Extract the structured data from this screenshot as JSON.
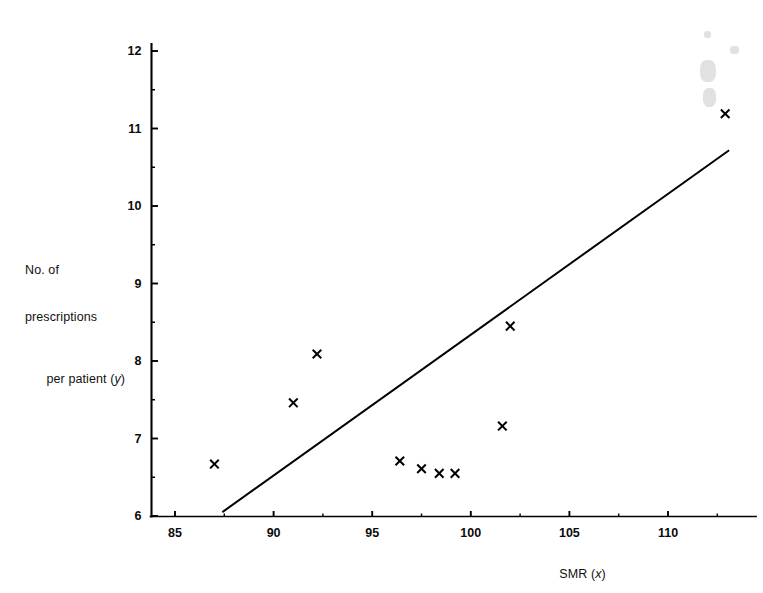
{
  "figure": {
    "background_color": "#ffffff",
    "ink_color": "#000000"
  },
  "chart_data": {
    "type": "scatter",
    "title": "",
    "xlabel": "SMR (x)",
    "ylabel_lines": [
      "No. of",
      "prescriptions",
      "per patient (y)"
    ],
    "ylabel": "No. of prescriptions per patient (y)",
    "marker": "x",
    "grid": false,
    "legend": false,
    "xlim": [
      83.0,
      114.2
    ],
    "ylim": [
      6,
      12.3
    ],
    "xticks": [
      85,
      90,
      95,
      100,
      105,
      110
    ],
    "xtick_labels": [
      "85",
      "90",
      "95",
      "100",
      "105",
      "110"
    ],
    "yticks": [
      6,
      7,
      8,
      9,
      10,
      11,
      12
    ],
    "ytick_labels": [
      "6",
      "7",
      "8",
      "9",
      "10",
      "11",
      "12"
    ],
    "x_minor_ticks": [
      87.5,
      92.5,
      97.5,
      102.5,
      107.5,
      112.5
    ],
    "y_minor_ticks": [
      6.5,
      7.5,
      8.5,
      9.5,
      10.5,
      11.5
    ],
    "x": [
      87.0,
      91.0,
      92.2,
      96.4,
      97.5,
      98.4,
      99.2,
      101.6,
      102.0,
      112.9
    ],
    "y": [
      6.67,
      7.46,
      8.09,
      6.71,
      6.61,
      6.55,
      6.55,
      7.16,
      8.45,
      11.19
    ],
    "points": [
      {
        "x": 87.0,
        "y": 6.67
      },
      {
        "x": 91.0,
        "y": 7.46
      },
      {
        "x": 92.2,
        "y": 8.09
      },
      {
        "x": 96.4,
        "y": 6.71
      },
      {
        "x": 97.5,
        "y": 6.61
      },
      {
        "x": 98.4,
        "y": 6.55
      },
      {
        "x": 99.2,
        "y": 6.55
      },
      {
        "x": 101.6,
        "y": 7.16
      },
      {
        "x": 102.0,
        "y": 8.45
      },
      {
        "x": 112.9,
        "y": 11.19
      }
    ],
    "fit_line": {
      "name": "regression line",
      "x0": 87.4,
      "y0": 6.05,
      "x1": 113.1,
      "y1": 10.72,
      "slope": 0.1817,
      "intercept": -9.83
    }
  }
}
